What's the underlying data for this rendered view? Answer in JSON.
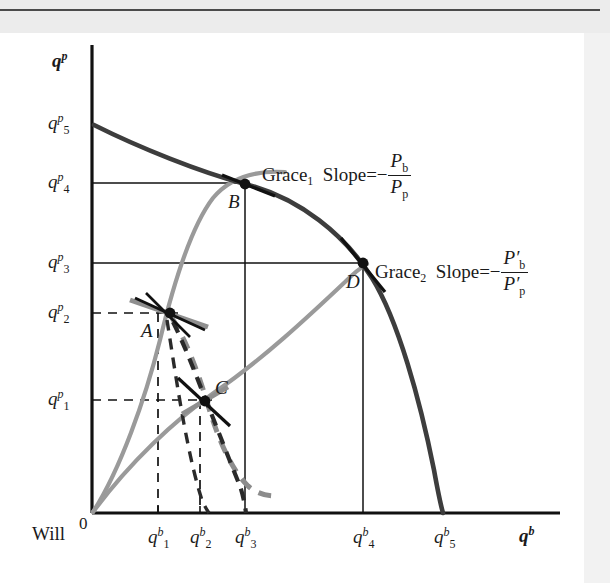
{
  "figure": {
    "type": "diagram",
    "kind": "production-possibility-frontier-with-indifference-curves",
    "origin_label": "0",
    "corner_label": "Will",
    "axes": {
      "x": {
        "title_base": "q",
        "title_sup": "b"
      },
      "y": {
        "title_base": "q",
        "title_sup": "p"
      }
    },
    "x_ticks": [
      {
        "base": "q",
        "sup": "b",
        "sub": "1",
        "x": 158
      },
      {
        "base": "q",
        "sup": "b",
        "sub": "2",
        "x": 198
      },
      {
        "base": "q",
        "sup": "b",
        "sub": "3",
        "x": 245
      },
      {
        "base": "q",
        "sup": "b",
        "sub": "4",
        "x": 363
      },
      {
        "base": "q",
        "sup": "b",
        "sub": "5",
        "x": 443
      }
    ],
    "y_ticks": [
      {
        "base": "q",
        "sup": "p",
        "sub": "1",
        "y": 400
      },
      {
        "base": "q",
        "sup": "p",
        "sub": "2",
        "y": 313
      },
      {
        "base": "q",
        "sup": "p",
        "sub": "3",
        "y": 263
      },
      {
        "base": "q",
        "sup": "p",
        "sub": "4",
        "y": 183
      },
      {
        "base": "q",
        "sup": "p",
        "sub": "5",
        "y": 124
      }
    ],
    "points": [
      {
        "id": "A",
        "label": "A",
        "x": 168,
        "y": 313
      },
      {
        "id": "B",
        "label": "B",
        "x": 245,
        "y": 183
      },
      {
        "id": "C",
        "label": "C",
        "x": 205,
        "y": 400
      },
      {
        "id": "D",
        "label": "D",
        "x": 363,
        "y": 263
      }
    ],
    "annotations": [
      {
        "id": "grace1",
        "name": "Grace",
        "sub": "1",
        "slope_text": "Slope=−",
        "numerator_base": "P",
        "numerator_sub": "b",
        "denominator_base": "P",
        "denominator_sub": "p",
        "prime": "",
        "x": 262,
        "y": 151
      },
      {
        "id": "grace2",
        "name": "Grace",
        "sub": "2",
        "slope_text": "Slope=−",
        "numerator_base": "P′",
        "numerator_sub": "b",
        "denominator_base": "P′",
        "denominator_sub": "p",
        "prime": "′",
        "x": 375,
        "y": 248
      }
    ],
    "colors": {
      "ppf_curve": "#3d3d3d",
      "gray_curve": "#9a9a9a",
      "tangent": "#111111",
      "dashed_dark": "#2a2a2a",
      "dashed_gray": "#8c8c8c",
      "axis": "#111111",
      "guide_line": "#111111",
      "page_background": "#ffffff",
      "margin_background": "#f2f2f2"
    },
    "geometry": {
      "origin": {
        "x": 92,
        "y": 513
      },
      "x_axis_end": 560,
      "y_axis_top": 45
    }
  }
}
